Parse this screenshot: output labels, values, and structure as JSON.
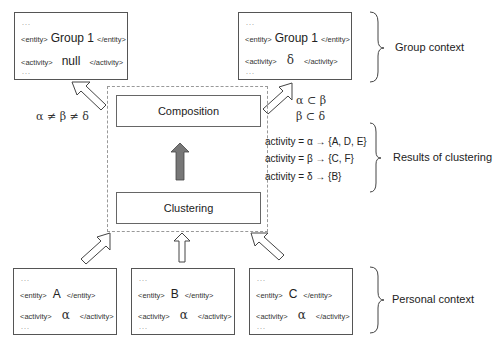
{
  "boxes": {
    "group_null": {
      "dots_top": "...",
      "entity_open": "<entity>",
      "entity": "Group 1",
      "entity_close": "</entity>",
      "activity_open": "<activity>",
      "activity": "null",
      "activity_close": "</activity>",
      "dots_bottom": "..."
    },
    "group_delta": {
      "dots_top": "...",
      "entity_open": "<entity>",
      "entity": "Group 1",
      "entity_close": "</entity>",
      "activity_open": "<activity>",
      "activity": "δ",
      "activity_close": "</activity>",
      "dots_bottom": "..."
    },
    "person_a": {
      "dots_top": "...",
      "entity_open": "<entity>",
      "entity": "A",
      "entity_close": "</entity>",
      "activity_open": "<activity>",
      "activity": "α",
      "activity_close": "</activity>",
      "dots_bottom": "..."
    },
    "person_b": {
      "dots_top": "...",
      "entity_open": "<entity>",
      "entity": "B",
      "entity_close": "</entity>",
      "activity_open": "<activity>",
      "activity": "α",
      "activity_close": "</activity>",
      "dots_bottom": "..."
    },
    "person_c": {
      "dots_top": "...",
      "entity_open": "<entity>",
      "entity": "C",
      "entity_close": "</entity>",
      "activity_open": "<activity>",
      "activity": "α",
      "activity_close": "</activity>",
      "dots_bottom": "..."
    }
  },
  "stages": {
    "composition": "Composition",
    "clustering": "Clustering"
  },
  "relations": {
    "not_equal": "α ≠ β ≠ δ",
    "subset_1": "α  ⊂  β",
    "subset_2": "β  ⊂  δ"
  },
  "clustering_results": [
    "activity = α → {A, D, E}",
    "activity = β → {C, F}",
    "activity = δ → {B}"
  ],
  "brace_labels": {
    "group_context": "Group context",
    "results_of_clustering": "Results of clustering",
    "personal_context": "Personal context"
  },
  "colors": {
    "gray_arrow": "#777777",
    "border": "#555555",
    "dotted_border": "#999999"
  }
}
